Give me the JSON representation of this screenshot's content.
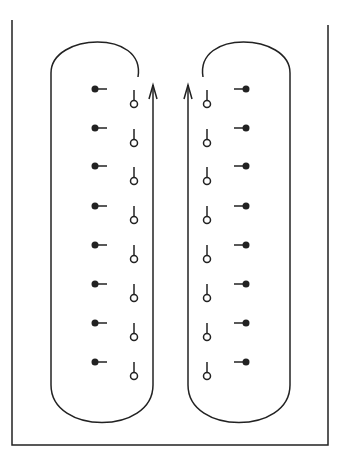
{
  "diagram": {
    "frame": {
      "left_x": 12,
      "right_x": 328,
      "bottom_y": 445,
      "left_top_y": 20,
      "right_top_y": 25
    },
    "colors": {
      "stroke": "#222222",
      "background": "#ffffff"
    },
    "loops": [
      {
        "name": "left-loop",
        "side": "left",
        "outer_x": 51,
        "inner_x": 153,
        "arc_end_x": 138,
        "arc_end_y": 77,
        "top_y": 37,
        "bottom_y": 425,
        "arrow": "up",
        "filled_dot_x": 95,
        "filled_dot_stub": "right",
        "open_circle_x": 134
      },
      {
        "name": "right-loop",
        "side": "right",
        "outer_x": 290,
        "inner_x": 188,
        "arc_end_x": 203,
        "arc_end_y": 77,
        "top_y": 37,
        "bottom_y": 425,
        "arrow": "up",
        "filled_dot_x": 246,
        "filled_dot_stub": "left",
        "open_circle_x": 207
      }
    ],
    "rows": {
      "filled_dot_y": [
        89,
        128,
        166,
        206,
        245,
        284,
        323,
        362
      ],
      "open_circle_y": [
        104,
        143,
        181,
        220,
        259,
        298,
        337,
        376
      ]
    },
    "legend": []
  }
}
